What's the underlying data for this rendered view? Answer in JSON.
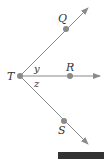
{
  "diagram": {
    "points": [
      {
        "name": "T",
        "label": "T",
        "x": 20,
        "y": 76
      },
      {
        "name": "Q",
        "label": "Q",
        "x": 66,
        "y": 29
      },
      {
        "name": "R",
        "label": "R",
        "x": 70,
        "y": 76
      },
      {
        "name": "S",
        "label": "S",
        "x": 64,
        "y": 121
      }
    ],
    "rays": [
      {
        "from": "T",
        "through": "Q"
      },
      {
        "from": "T",
        "through": "R"
      },
      {
        "from": "T",
        "through": "S"
      }
    ],
    "angle_labels": {
      "upper": "y",
      "lower": "z"
    },
    "colors": {
      "line": "#8a8a8a",
      "point": "#8a8a8a",
      "text": "#333333",
      "bar": "#333333"
    }
  }
}
